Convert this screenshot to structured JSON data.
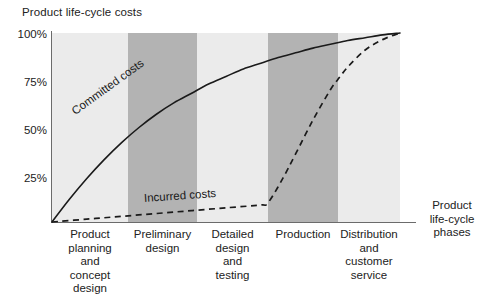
{
  "chart_data": {
    "type": "line",
    "title": "Product life-cycle costs",
    "xlabel": "Product life-cycle phases",
    "ylabel": "",
    "ylim": [
      0,
      100
    ],
    "grid": false,
    "legend": "inline-labels",
    "y_ticks": [
      "25%",
      "50%",
      "75%",
      "100%"
    ],
    "y_tick_values": [
      25,
      50,
      75,
      100
    ],
    "categories": [
      "Product planning and concept design",
      "Preliminary design",
      "Detailed design and testing",
      "Production",
      "Distribution and customer service"
    ],
    "category_labels": [
      [
        "Product",
        "planning",
        "and",
        "concept",
        "design"
      ],
      [
        "Preliminary",
        "design"
      ],
      [
        "Detailed",
        "design",
        "and",
        "testing"
      ],
      [
        "Production"
      ],
      [
        "Distribution",
        "and",
        "customer",
        "service"
      ]
    ],
    "band_shading": [
      "light",
      "dark",
      "light",
      "dark",
      "light"
    ],
    "series": [
      {
        "name": "Committed costs",
        "style": "solid",
        "x": [
          0,
          5,
          10,
          15,
          20,
          25,
          30,
          35,
          40,
          45,
          50,
          55,
          60,
          65,
          70,
          75,
          80,
          85,
          90,
          95,
          100
        ],
        "values": [
          0,
          12,
          23,
          33,
          42,
          50,
          57,
          63,
          68,
          73,
          77,
          81,
          84,
          87,
          89.5,
          92,
          94,
          96,
          97.5,
          99,
          100
        ]
      },
      {
        "name": "Incurred costs",
        "style": "dashed",
        "x": [
          0,
          10,
          20,
          30,
          40,
          50,
          60,
          62,
          66,
          70,
          75,
          80,
          82,
          85,
          90,
          95,
          100
        ],
        "values": [
          0,
          1.5,
          3,
          4.5,
          6,
          7.5,
          9,
          10,
          22,
          36,
          54,
          70,
          75,
          82,
          91,
          96.5,
          100
        ]
      }
    ],
    "colors": {
      "band_light": "#ebebeb",
      "band_dark": "#b3b3b3",
      "axis": "#6b6b6b",
      "curve": "#1a1a1a",
      "text": "#222222",
      "background": "#ffffff"
    }
  }
}
